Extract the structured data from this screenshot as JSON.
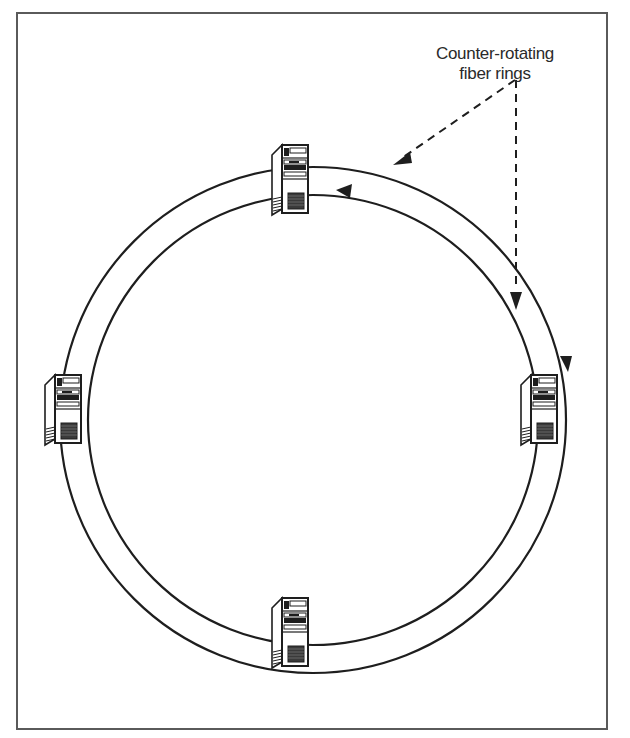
{
  "diagram": {
    "type": "network-topology",
    "topology": "dual counter-rotating ring",
    "callout": {
      "lines": [
        "Counter-rotating",
        "fiber rings"
      ]
    },
    "rings": [
      {
        "name": "outer-ring",
        "direction": "clockwise"
      },
      {
        "name": "inner-ring",
        "direction": "counter-clockwise"
      }
    ],
    "nodes": [
      {
        "name": "computer-top",
        "position": "top"
      },
      {
        "name": "computer-right",
        "position": "right"
      },
      {
        "name": "computer-bottom",
        "position": "bottom"
      },
      {
        "name": "computer-left",
        "position": "left"
      }
    ],
    "colors": {
      "line": "#1e1e1e",
      "frame": "#5a5a5a",
      "background": "#ffffff"
    }
  }
}
